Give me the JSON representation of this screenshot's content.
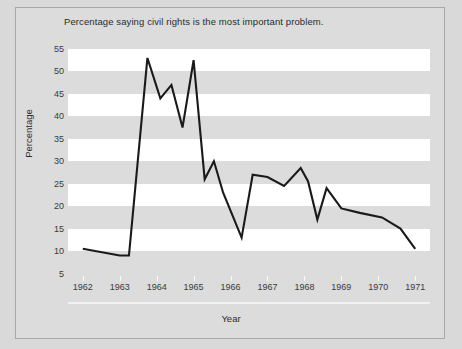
{
  "figure": {
    "background_color": "#dcdcdc",
    "border_color": "#a8a8a8",
    "band_color": "#ffffff",
    "line_color": "#1a1a1a",
    "text_color": "#2b2b2b"
  },
  "chart_data": {
    "type": "line",
    "title": "Percentage saying civil rights is the most important problem.",
    "xlabel": "Year",
    "ylabel": "Percentage",
    "xlim": [
      1961.6,
      1971.4
    ],
    "ylim": [
      4.0,
      57.0
    ],
    "yticks": [
      5,
      10,
      15,
      20,
      25,
      30,
      35,
      40,
      45,
      50,
      55
    ],
    "xticks": [
      1962,
      1963,
      1964,
      1965,
      1966,
      1967,
      1968,
      1969,
      1970,
      1971
    ],
    "xticklabels": [
      "1962",
      "1963",
      "1964",
      "1965",
      "1966",
      "1967",
      "1968",
      "1969",
      "1970",
      "1971"
    ],
    "grid": false,
    "banded_background": true,
    "legend": null,
    "series": [
      {
        "name": "Civil rights most important problem",
        "x": [
          1962.0,
          1963.0,
          1963.25,
          1963.75,
          1964.1,
          1964.4,
          1964.7,
          1965.0,
          1965.3,
          1965.55,
          1965.8,
          1966.05,
          1966.3,
          1966.6,
          1967.0,
          1967.45,
          1967.9,
          1968.1,
          1968.35,
          1968.6,
          1969.0,
          1969.5,
          1970.1,
          1970.6,
          1971.0
        ],
        "y": [
          10.5,
          9.0,
          9.0,
          53.0,
          44.0,
          47.0,
          37.5,
          52.5,
          26.0,
          30.0,
          23.0,
          18.0,
          13.0,
          27.0,
          26.5,
          24.5,
          28.5,
          25.5,
          17.0,
          24.0,
          19.5,
          18.5,
          17.5,
          15.0,
          10.5
        ]
      }
    ]
  }
}
